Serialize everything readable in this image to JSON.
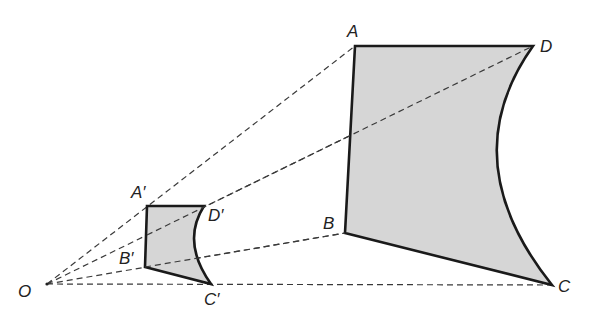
{
  "diagram": {
    "type": "enlargement",
    "center": {
      "label": "O",
      "x": 47,
      "y": 284
    },
    "large_shape": {
      "vertices": [
        {
          "label": "A",
          "x": 355,
          "y": 46
        },
        {
          "label": "D",
          "x": 533,
          "y": 46
        },
        {
          "label": "C",
          "x": 552,
          "y": 285
        },
        {
          "label": "B",
          "x": 345,
          "y": 233
        }
      ],
      "curved_edge": "D-C"
    },
    "small_shape": {
      "vertices": [
        {
          "label": "A′",
          "x": 147,
          "y": 206
        },
        {
          "label": "D′",
          "x": 204,
          "y": 206
        },
        {
          "label": "C′",
          "x": 211,
          "y": 284
        },
        {
          "label": "B′",
          "x": 145,
          "y": 267
        }
      ],
      "curved_edge": "D′-C′"
    },
    "rays": [
      "O-A",
      "O-D",
      "O-B",
      "O-C"
    ],
    "fill_color": "#d6d6d6",
    "stroke_color": "#1a1a1a"
  },
  "labels": {
    "O": "O",
    "A": "A",
    "B": "B",
    "C": "C",
    "D": "D",
    "A_prime": "A′",
    "B_prime": "B′",
    "C_prime": "C′",
    "D_prime": "D′"
  }
}
